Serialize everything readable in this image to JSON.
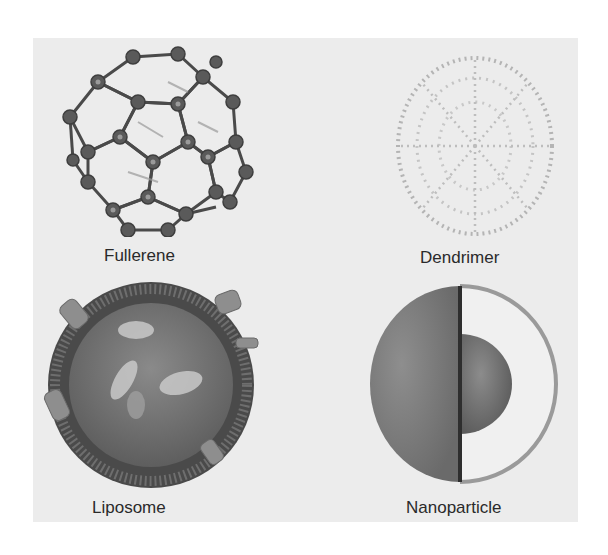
{
  "figure": {
    "panels": [
      {
        "id": "fullerene",
        "label": "Fullerene",
        "icon": "fullerene-icon"
      },
      {
        "id": "dendrimer",
        "label": "Dendrimer",
        "icon": "dendrimer-icon"
      },
      {
        "id": "liposome",
        "label": "Liposome",
        "icon": "liposome-icon"
      },
      {
        "id": "nanoparticle",
        "label": "Nanoparticle",
        "icon": "nanoparticle-icon"
      }
    ],
    "colors": {
      "background": "#ffffff",
      "panel": "#ececec",
      "structure_dark": "#555555",
      "structure_mid": "#8a8a8a",
      "label_text": "#2a2a2a"
    }
  }
}
